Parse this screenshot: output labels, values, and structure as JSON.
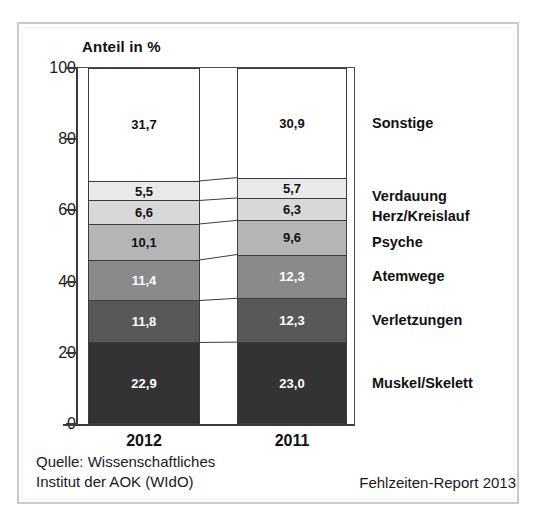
{
  "chart_data": {
    "type": "bar",
    "title": "",
    "ylabel": "Anteil in %",
    "xlabel": "",
    "ylim": [
      0,
      100
    ],
    "yticks": [
      0,
      20,
      40,
      60,
      80,
      100
    ],
    "ytick_labels": [
      "0",
      "20",
      "40",
      "60",
      "80",
      "100"
    ],
    "grid": false,
    "stacked": true,
    "normalized_percent": true,
    "legend_position": "right",
    "categories": [
      "2012",
      "2011"
    ],
    "series": [
      {
        "name": "Muskel/Skelett",
        "values": [
          22.9,
          23.0
        ],
        "labels": [
          "22,9",
          "23,0"
        ],
        "color": "#333333",
        "text_color": "#ffffff"
      },
      {
        "name": "Verletzungen",
        "values": [
          11.8,
          12.3
        ],
        "labels": [
          "11,8",
          "12,3"
        ],
        "color": "#585858",
        "text_color": "#ffffff"
      },
      {
        "name": "Atemwege",
        "values": [
          11.4,
          12.3
        ],
        "labels": [
          "11,4",
          "12,3"
        ],
        "color": "#8a8a8a",
        "text_color": "#ffffff"
      },
      {
        "name": "Psyche",
        "values": [
          10.1,
          9.6
        ],
        "labels": [
          "10,1",
          "9,6"
        ],
        "color": "#b5b5b5",
        "text_color": "#111111"
      },
      {
        "name": "Herz/Kreislauf",
        "values": [
          6.6,
          6.3
        ],
        "labels": [
          "6,6",
          "6,3"
        ],
        "color": "#d8d8d8",
        "text_color": "#111111"
      },
      {
        "name": "Verdauung",
        "values": [
          5.5,
          5.7
        ],
        "labels": [
          "5,5",
          "5,7"
        ],
        "color": "#e9e9e9",
        "text_color": "#111111"
      },
      {
        "name": "Sonstige",
        "values": [
          31.7,
          30.9
        ],
        "labels": [
          "31,7",
          "30,9"
        ],
        "color": "#ffffff",
        "text_color": "#111111"
      }
    ]
  },
  "axis": {
    "title": "Anteil in %"
  },
  "legend": {
    "items": [
      {
        "label": "Sonstige"
      },
      {
        "label": "Verdauung"
      },
      {
        "label": "Herz/Kreislauf"
      },
      {
        "label": "Psyche"
      },
      {
        "label": "Atemwege"
      },
      {
        "label": "Verletzungen"
      },
      {
        "label": "Muskel/Skelett"
      }
    ]
  },
  "footer": {
    "source_line1": "Quelle: Wissenschaftliches",
    "source_line2": "Institut der AOK (WIdO)",
    "report": "Fehlzeiten-Report 2013"
  }
}
